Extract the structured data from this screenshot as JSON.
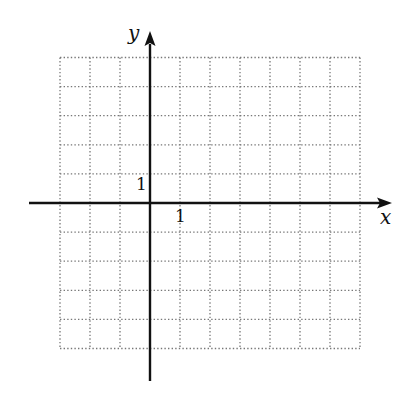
{
  "chart_data": {
    "type": "coordinate-grid",
    "title": "",
    "xlabel": "x",
    "ylabel": "y",
    "x_tick_label": "1",
    "y_tick_label": "1",
    "grid": true,
    "grid_style": "dotted",
    "grid_x_range": [
      -3,
      7
    ],
    "grid_y_range": [
      -5,
      5
    ],
    "unit": 1,
    "annotations": [
      "1 marked on x-axis at x=1",
      "1 marked on y-axis at y=1"
    ]
  },
  "colors": {
    "axis": "#111111",
    "grid": "#777777",
    "background": "#ffffff"
  },
  "labels": {
    "x_axis": "x",
    "y_axis": "y",
    "x_unit": "1",
    "y_unit": "1"
  }
}
